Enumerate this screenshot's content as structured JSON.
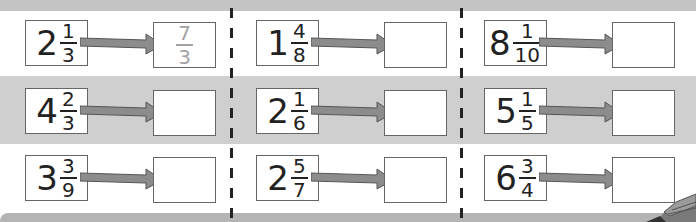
{
  "worksheet": {
    "instruction": "Convert each mixed number to an improper fraction",
    "colors": {
      "band_grey": "#cfcfcf",
      "arrow_fill": "#8c8c8c",
      "answer_text": "#a3a3a3",
      "box_border": "#666666"
    },
    "columns": [
      {
        "rows": [
          {
            "whole": "2",
            "num": "1",
            "den": "3",
            "answer": {
              "num": "7",
              "den": "3"
            }
          },
          {
            "whole": "4",
            "num": "2",
            "den": "3",
            "answer": null
          },
          {
            "whole": "3",
            "num": "3",
            "den": "9",
            "answer": null
          }
        ]
      },
      {
        "rows": [
          {
            "whole": "1",
            "num": "4",
            "den": "8",
            "answer": null
          },
          {
            "whole": "2",
            "num": "1",
            "den": "6",
            "answer": null
          },
          {
            "whole": "2",
            "num": "5",
            "den": "7",
            "answer": null
          }
        ]
      },
      {
        "rows": [
          {
            "whole": "8",
            "num": "1",
            "den": "10",
            "answer": null
          },
          {
            "whole": "5",
            "num": "1",
            "den": "5",
            "answer": null
          },
          {
            "whole": "6",
            "num": "3",
            "den": "4",
            "answer": null
          }
        ]
      }
    ]
  }
}
